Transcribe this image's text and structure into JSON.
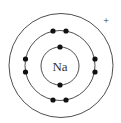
{
  "diagram": {
    "type": "bohr-model",
    "element_symbol": "Na",
    "charge": "+",
    "colors": {
      "line": "#3a3a3a",
      "electron": "#111111",
      "text": "#333333",
      "background": "#ffffff"
    },
    "nucleus": {
      "cx": 60,
      "cy": 66,
      "r": 19
    },
    "shells": [
      {
        "name": "inner-shell",
        "r": 19,
        "electrons": 2
      },
      {
        "name": "middle-shell",
        "r": 35,
        "electrons": 8
      },
      {
        "name": "outer-shell",
        "r": 52,
        "electrons": 0
      }
    ],
    "electrons": [
      {
        "shell": 1,
        "x": 60,
        "y": 47
      },
      {
        "shell": 1,
        "x": 60,
        "y": 85
      },
      {
        "shell": 2,
        "x": 53,
        "y": 31
      },
      {
        "shell": 2,
        "x": 66,
        "y": 31
      },
      {
        "shell": 2,
        "x": 53,
        "y": 100
      },
      {
        "shell": 2,
        "x": 66,
        "y": 100
      },
      {
        "shell": 2,
        "x": 25,
        "y": 59
      },
      {
        "shell": 2,
        "x": 25,
        "y": 72
      },
      {
        "shell": 2,
        "x": 95,
        "y": 59
      },
      {
        "shell": 2,
        "x": 95,
        "y": 72
      }
    ]
  }
}
